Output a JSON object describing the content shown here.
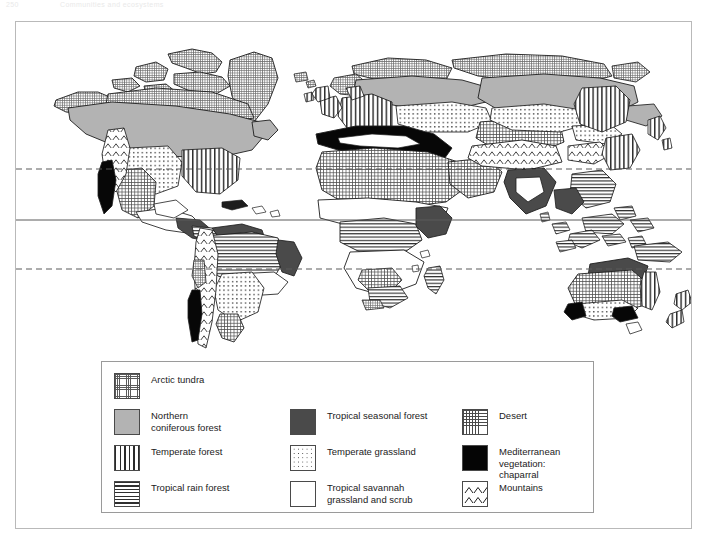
{
  "running_head": {
    "page_number": "250",
    "title": "Communities and ecosystems"
  },
  "figure": {
    "type": "world-biome-map",
    "reference_lines": [
      {
        "name": "tropic-of-cancer",
        "style": "dashed",
        "y": 147
      },
      {
        "name": "equator",
        "style": "solid",
        "y": 198
      },
      {
        "name": "tropic-of-capricorn",
        "style": "dashed",
        "y": 247
      }
    ]
  },
  "legend": {
    "columns": [
      {
        "name": "legend-column-1",
        "items": [
          {
            "label": "Arctic tundra",
            "pattern": "sw-tundra",
            "swatch_name": "swatch-arctic-tundra"
          },
          {
            "label": "Northern\nconiferous forest",
            "pattern": "sw-conifer",
            "swatch_name": "swatch-northern-coniferous-forest"
          },
          {
            "label": "Temperate forest",
            "pattern": "sw-temperate-forest",
            "swatch_name": "swatch-temperate-forest"
          },
          {
            "label": "Tropical rain forest",
            "pattern": "sw-rainforest",
            "swatch_name": "swatch-tropical-rain-forest"
          }
        ]
      },
      {
        "name": "legend-column-2",
        "items": [
          {
            "label": "",
            "pattern": "spacer",
            "swatch_name": "swatch-spacer"
          },
          {
            "label": "Tropical seasonal forest",
            "pattern": "sw-seasonal",
            "swatch_name": "swatch-tropical-seasonal-forest"
          },
          {
            "label": "Temperate grassland",
            "pattern": "sw-temp-grass",
            "swatch_name": "swatch-temperate-grassland"
          },
          {
            "label": "Tropical savannah\ngrassland and scrub",
            "pattern": "sw-savannah",
            "swatch_name": "swatch-tropical-savannah"
          }
        ]
      },
      {
        "name": "legend-column-3",
        "items": [
          {
            "label": "",
            "pattern": "spacer",
            "swatch_name": "swatch-spacer"
          },
          {
            "label": "Desert",
            "pattern": "sw-desert",
            "swatch_name": "swatch-desert"
          },
          {
            "label": "Mediterranean vegetation:\nchaparral",
            "pattern": "sw-chaparral",
            "swatch_name": "swatch-mediterranean-chaparral"
          },
          {
            "label": "Mountains",
            "pattern": "sw-mountains",
            "swatch_name": "swatch-mountains"
          }
        ]
      }
    ]
  },
  "colors": {
    "frame_border": "#b9b9b9",
    "legend_border": "#9a9a9a",
    "coastline": "#1d1d1d",
    "conifer_gray": "#b3b3b3",
    "seasonal_gray": "#4a4a4a",
    "chaparral_black": "#050505",
    "text": "#1b1b1b",
    "reference_line": "#5a5a5a"
  }
}
